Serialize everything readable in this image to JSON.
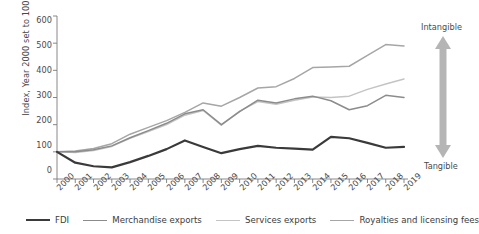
{
  "chart_data": {
    "type": "line",
    "title": "",
    "xlabel": "",
    "ylabel": "Index, Year 2000 set to 100",
    "ylim": [
      0,
      600
    ],
    "yticks": [
      0,
      100,
      200,
      300,
      400,
      500,
      600
    ],
    "grid": false,
    "legend_position": "bottom",
    "categories": [
      "2000",
      "2001",
      "2002",
      "2003",
      "2004",
      "2005",
      "2006",
      "2007",
      "2008",
      "2009",
      "2010",
      "2011",
      "2012",
      "2013",
      "2014",
      "2015",
      "2016",
      "2017",
      "2018",
      "2019"
    ],
    "series": [
      {
        "name": "FDI",
        "color": "#3a3a3a",
        "width": 2.2,
        "values": [
          100,
          60,
          47,
          43,
          62,
          85,
          110,
          142,
          118,
          95,
          110,
          122,
          115,
          112,
          108,
          155,
          150,
          133,
          115,
          118
        ]
      },
      {
        "name": "Merchandise exports",
        "color": "#8c8c8c",
        "width": 1.5,
        "values": [
          100,
          100,
          108,
          122,
          152,
          178,
          205,
          240,
          255,
          200,
          248,
          290,
          280,
          295,
          305,
          288,
          255,
          270,
          308,
          300
        ]
      },
      {
        "name": "Services exports",
        "color": "#c4c4c4",
        "width": 1.5,
        "values": [
          100,
          98,
          105,
          120,
          150,
          175,
          200,
          235,
          252,
          198,
          250,
          285,
          275,
          290,
          302,
          300,
          305,
          330,
          350,
          368
        ]
      },
      {
        "name": "Royalties and licensing fees",
        "color": "#a6a6a6",
        "width": 1.5,
        "values": [
          100,
          103,
          112,
          130,
          165,
          190,
          215,
          245,
          280,
          268,
          300,
          335,
          340,
          370,
          410,
          412,
          415,
          455,
          495,
          490
        ]
      }
    ],
    "annotations": [
      {
        "name": "intangible",
        "text": "Intangible",
        "position": "top-right"
      },
      {
        "name": "tangible",
        "text": "Tangible",
        "position": "bottom-right"
      },
      {
        "name": "axis-arrow",
        "text": "",
        "color": "#b5b5b5"
      }
    ]
  },
  "axis": {
    "y_label": "Index, Year 2000 set to 100",
    "y_ticks": [
      "0",
      "100",
      "200",
      "300",
      "400",
      "500",
      "600"
    ],
    "x_ticks": [
      "2000",
      "2001",
      "2002",
      "2003",
      "2004",
      "2005",
      "2006",
      "2007",
      "2008",
      "2009",
      "2010",
      "2011",
      "2012",
      "2013",
      "2014",
      "2015",
      "2016",
      "2017",
      "2018",
      "2019"
    ],
    "axis_color": "#7a7a7a"
  },
  "legend": {
    "items": [
      {
        "label": "FDI",
        "color": "#3a3a3a",
        "thickness": 2.4
      },
      {
        "label": "Merchandise exports",
        "color": "#8c8c8c",
        "thickness": 1.6
      },
      {
        "label": "Services exports",
        "color": "#c4c4c4",
        "thickness": 1.6
      },
      {
        "label": "Royalties and licensing fees",
        "color": "#a6a6a6",
        "thickness": 1.6
      }
    ]
  },
  "annotations": {
    "intangible": "Intangible",
    "tangible": "Tangible"
  }
}
